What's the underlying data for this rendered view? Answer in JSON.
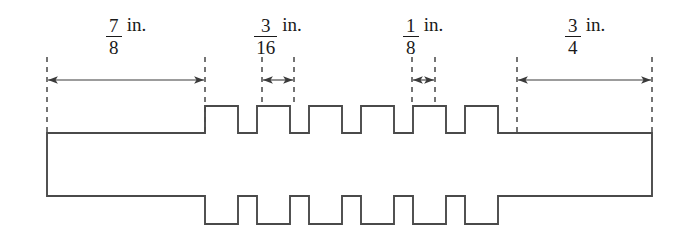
{
  "figure": {
    "stroke_color": "#4a4a4a",
    "dash_color": "#3a3a3a",
    "text_color": "#1a1a1a",
    "background": "#ffffff",
    "width": 686,
    "height": 249
  },
  "dimensions": [
    {
      "id": "left-shank-length",
      "numerator": "7",
      "denominator": "8",
      "unit": "in.",
      "label_text": "7/8 in.",
      "line_y": 80,
      "from_x": 47,
      "to_x": 205,
      "extension_top": 57,
      "extension_bottom": 133,
      "label_center_x": 126,
      "label_y": 14,
      "arrow_style": "inside"
    },
    {
      "id": "tooth-width",
      "numerator": "3",
      "denominator": "16",
      "unit": "in.",
      "label_text": "3/16 in.",
      "line_y": 80,
      "from_x": 262,
      "to_x": 294,
      "extension_top": 57,
      "extension_bottom": 106,
      "label_center_x": 278,
      "label_y": 14,
      "arrow_style": "inside"
    },
    {
      "id": "groove-width",
      "numerator": "1",
      "denominator": "8",
      "unit": "in.",
      "label_text": "1/8 in.",
      "line_y": 80,
      "from_x": 412,
      "to_x": 435,
      "extension_top": 57,
      "extension_bottom": 106,
      "label_center_x": 423,
      "label_y": 14,
      "arrow_style": "inside"
    },
    {
      "id": "right-shank-length",
      "numerator": "3",
      "denominator": "4",
      "unit": "in.",
      "label_text": "3/4 in.",
      "line_y": 80,
      "from_x": 517,
      "to_x": 652,
      "extension_top": 57,
      "extension_bottom": 133,
      "label_center_x": 585,
      "label_y": 14,
      "arrow_style": "inside"
    }
  ],
  "shaft": {
    "left_x": 47,
    "right_x": 652,
    "body_top_y": 133,
    "body_bottom_y": 196,
    "tooth_top_y": 106,
    "tooth_bottom_y": 224,
    "teeth_start_x": 205,
    "teeth_end_x": 517,
    "tooth_count": 6,
    "tooth_width": 33,
    "tooth_pitch": 52
  }
}
